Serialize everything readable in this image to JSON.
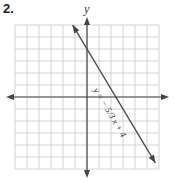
{
  "problem_number": "2.",
  "chart_data": {
    "type": "line",
    "title": "",
    "xlabel": "",
    "ylabel": "y",
    "xlim": [
      -6,
      6
    ],
    "ylim": [
      -6,
      6
    ],
    "grid": true,
    "equation": "y = -5/3 x + 4",
    "equation_label": "y = − 5/3 x + 4",
    "slope": -1.6667,
    "y_intercept": 4,
    "x_intercept": 2.4,
    "series": [
      {
        "name": "y = -5/3 x + 4",
        "x": [
          -1.2,
          5.7
        ],
        "y": [
          6.0,
          -5.5
        ]
      }
    ]
  }
}
